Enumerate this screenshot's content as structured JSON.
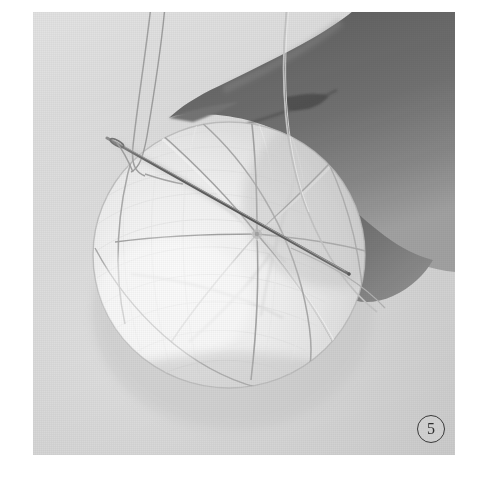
{
  "page": {
    "background_color": "#ffffff",
    "width": 486,
    "height": 502
  },
  "figure": {
    "caption_number": "5",
    "badge_style": "circled-number",
    "photo": {
      "left": 33,
      "top": 12,
      "width": 422,
      "height": 443,
      "background_color": "#dcdcdc",
      "print_style": "halftone-grayscale"
    },
    "subjects": [
      {
        "name": "hand",
        "description": "Fingers and thumb gripping the ball from the upper right",
        "color": "#5a5a5a"
      },
      {
        "name": "temari-ball",
        "description": "White wrapped thread ball marked into eight radial sections meeting at a pole",
        "color": "#f4f4f4",
        "sections": 8
      },
      {
        "name": "needle",
        "description": "Long straight sewing needle entering from upper left at a downward-right diagonal",
        "color": "#6f6f6f"
      },
      {
        "name": "thread",
        "description": "Fine thread looped through the needle eye and trailing up off the top of the frame",
        "color": "#8d8d8d"
      }
    ]
  }
}
